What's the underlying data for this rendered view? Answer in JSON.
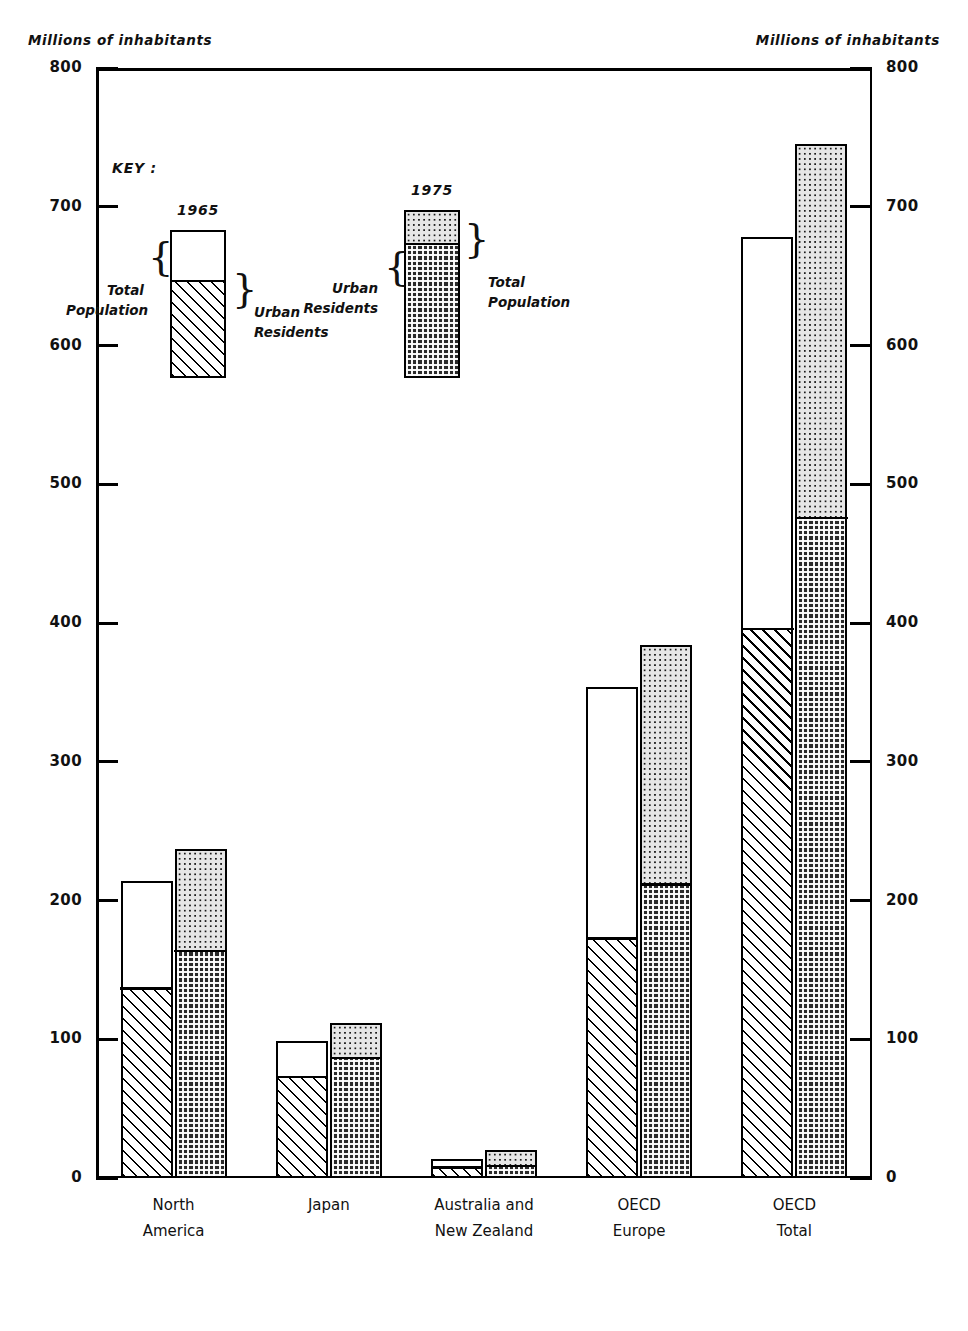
{
  "axis": {
    "left_caption": "Millions of inhabitants",
    "right_caption": "Millions of inhabitants",
    "ticks": [
      "800",
      "700",
      "600",
      "500",
      "400",
      "300",
      "200",
      "100",
      "0"
    ]
  },
  "key": {
    "title": "KEY :",
    "year_1965": "1965",
    "year_1975": "1975",
    "total_population_left": "Total\nPopulation",
    "urban_residents_left": "Urban\nResidents",
    "urban_residents_right": "Urban\nResidents",
    "total_population_right": "Total\nPopulation",
    "brace_glyph": "}"
  },
  "chart_data": {
    "type": "bar",
    "title": "",
    "subtitle": "",
    "xlabel": "",
    "ylabel": "Millions of inhabitants",
    "ylim": [
      0,
      800
    ],
    "ytick_step": 100,
    "grid": false,
    "legend_position": "inside-upper-left",
    "categories": [
      "North\nAmerica",
      "Japan",
      "Australia and\nNew Zealand",
      "OECD\nEurope",
      "OECD\nTotal"
    ],
    "series": [
      {
        "name": "1965 Total Population",
        "values": [
          214,
          99,
          14,
          354,
          678
        ]
      },
      {
        "name": "1965 Urban Residents",
        "values": [
          138,
          74,
          9,
          174,
          397
        ]
      },
      {
        "name": "1975 Total Population",
        "values": [
          237,
          112,
          20,
          384,
          745
        ]
      },
      {
        "name": "1975 Urban Residents",
        "values": [
          165,
          88,
          10,
          213,
          477
        ]
      }
    ]
  }
}
